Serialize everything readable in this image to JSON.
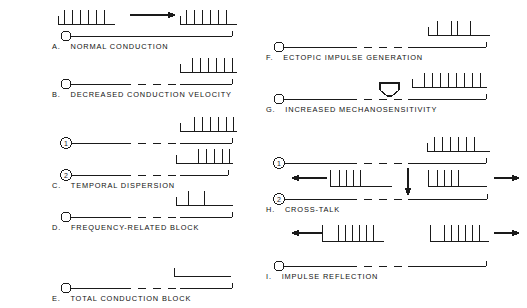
{
  "figure": {
    "stroke_color": "#1a1a1a",
    "background": "#ffffff"
  },
  "panels": [
    {
      "id": "A",
      "letter": "A.",
      "label": "NORMAL CONDUCTION",
      "axon_style": "solid",
      "start_marker": "open-circle",
      "arrow": "right-arrow-middle",
      "spike_trains": [
        {
          "position": "proximal",
          "count": 6,
          "pattern": "regular"
        },
        {
          "position": "distal",
          "count": 6,
          "pattern": "regular"
        }
      ]
    },
    {
      "id": "B",
      "letter": "B.",
      "label": "DECREASED CONDUCTION VELOCITY",
      "axon_style": "dashed-segment",
      "start_marker": "open-circle",
      "arrow": "none",
      "spike_trains": [
        {
          "position": "distal",
          "count": 6,
          "pattern": "regular"
        }
      ]
    },
    {
      "id": "C",
      "letter": "C.",
      "label": "TEMPORAL DISPERSION",
      "axon_style": "dashed-segment",
      "start_marker": "circled-number",
      "fiber_labels": [
        "1",
        "2"
      ],
      "arrow": "none",
      "spike_trains": [
        {
          "position": "distal-fiber-1",
          "count": 6,
          "pattern": "regular"
        },
        {
          "position": "distal-fiber-2",
          "count": 5,
          "pattern": "regular"
        }
      ]
    },
    {
      "id": "D",
      "letter": "D.",
      "label": "FREQUENCY-RELATED BLOCK",
      "axon_style": "dashed-segment",
      "start_marker": "open-circle",
      "arrow": "none",
      "spike_trains": [
        {
          "position": "distal",
          "count": 2,
          "pattern": "sparse"
        }
      ]
    },
    {
      "id": "E",
      "letter": "E.",
      "label": "TOTAL CONDUCTION BLOCK",
      "axon_style": "dashed-segment",
      "start_marker": "open-circle",
      "arrow": "none",
      "spike_trains": [
        {
          "position": "distal",
          "count": 0,
          "pattern": "none"
        }
      ]
    },
    {
      "id": "F",
      "letter": "F.",
      "label": "ECTOPIC IMPULSE GENERATION",
      "axon_style": "dashed-segment",
      "start_marker": "open-circle",
      "arrow": "none",
      "spike_trains": [
        {
          "position": "distal",
          "count": 4,
          "pattern": "irregular"
        }
      ]
    },
    {
      "id": "G",
      "letter": "G.",
      "label": "INCREASED MECHANOSENSITIVITY",
      "axon_style": "dashed-segment",
      "start_marker": "open-circle",
      "arrow": "hollow-down-arrow",
      "spike_trains": [
        {
          "position": "distal",
          "count": 8,
          "pattern": "regular"
        }
      ]
    },
    {
      "id": "H",
      "letter": "H.",
      "label": "CROSS-TALK",
      "axon_style": "dashed-segment",
      "start_marker": "circled-number",
      "fiber_labels": [
        "1",
        "2"
      ],
      "arrow": "down-arrow-between-fibers",
      "side_arrows": [
        "left",
        "right"
      ],
      "spike_trains": [
        {
          "position": "distal-fiber-1",
          "count": 6,
          "pattern": "regular"
        },
        {
          "position": "retrograde-fiber-2",
          "count": 4,
          "pattern": "regular"
        },
        {
          "position": "orthograde-fiber-2",
          "count": 4,
          "pattern": "regular"
        }
      ]
    },
    {
      "id": "I",
      "letter": "I.",
      "label": "IMPULSE REFLECTION",
      "axon_style": "dashed-segment",
      "start_marker": "open-circle",
      "side_arrows": [
        "left",
        "right"
      ],
      "spike_trains": [
        {
          "position": "retrograde",
          "count": 6,
          "pattern": "regular"
        },
        {
          "position": "orthograde",
          "count": 6,
          "pattern": "regular"
        }
      ]
    }
  ]
}
